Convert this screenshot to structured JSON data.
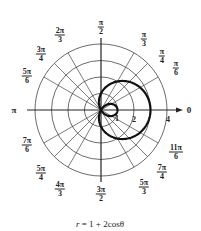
{
  "chart_data": {
    "type": "polar",
    "title": "",
    "equation": "r = 1 + 2cosθ",
    "caption": {
      "var": "r",
      "rest": " = 1 + 2cosθ"
    },
    "series": [
      {
        "name": "r = 1 + 2cosθ",
        "function": "1 + 2*cos(theta)",
        "theta_range": [
          0,
          6.2832
        ],
        "curve": "limaçon with inner loop"
      }
    ],
    "radial_ticks": [
      1,
      2,
      3,
      4
    ],
    "radial_labels": [
      {
        "r": 1,
        "text": "1"
      },
      {
        "r": 2,
        "text": "2"
      },
      {
        "r": 4,
        "text": "4"
      }
    ],
    "rmax": 4,
    "grid": true,
    "angle_labels": [
      {
        "deg": 0,
        "type": "single",
        "text": "0"
      },
      {
        "deg": 30,
        "type": "frac",
        "num": "π",
        "den": "6"
      },
      {
        "deg": 45,
        "type": "frac",
        "num": "π",
        "den": "4"
      },
      {
        "deg": 60,
        "type": "frac",
        "num": "π",
        "den": "3"
      },
      {
        "deg": 90,
        "type": "frac",
        "num": "π",
        "den": "2"
      },
      {
        "deg": 120,
        "type": "frac",
        "num": "2π",
        "den": "3"
      },
      {
        "deg": 135,
        "type": "frac",
        "num": "3π",
        "den": "4"
      },
      {
        "deg": 150,
        "type": "frac",
        "num": "5π",
        "den": "6"
      },
      {
        "deg": 180,
        "type": "single",
        "text": "π"
      },
      {
        "deg": 210,
        "type": "frac",
        "num": "7π",
        "den": "6"
      },
      {
        "deg": 225,
        "type": "frac",
        "num": "5π",
        "den": "4"
      },
      {
        "deg": 240,
        "type": "frac",
        "num": "4π",
        "den": "3"
      },
      {
        "deg": 270,
        "type": "frac",
        "num": "3π",
        "den": "2"
      },
      {
        "deg": 300,
        "type": "frac",
        "num": "5π",
        "den": "3"
      },
      {
        "deg": 315,
        "type": "frac",
        "num": "7π",
        "den": "4"
      },
      {
        "deg": 330,
        "type": "frac",
        "num": "11π",
        "den": "6"
      }
    ]
  },
  "labels": {
    "a0": "0",
    "a180": "π",
    "a30": {
      "num": "π",
      "den": "6"
    },
    "a45": {
      "num": "π",
      "den": "4"
    },
    "a60": {
      "num": "π",
      "den": "3"
    },
    "a90": {
      "num": "π",
      "den": "2"
    },
    "a120": {
      "num": "2π",
      "den": "3"
    },
    "a135": {
      "num": "3π",
      "den": "4"
    },
    "a150": {
      "num": "5π",
      "den": "6"
    },
    "a210": {
      "num": "7π",
      "den": "6"
    },
    "a225": {
      "num": "5π",
      "den": "4"
    },
    "a240": {
      "num": "4π",
      "den": "3"
    },
    "a270": {
      "num": "3π",
      "den": "2"
    },
    "a300": {
      "num": "5π",
      "den": "3"
    },
    "a315": {
      "num": "7π",
      "den": "4"
    },
    "a330": {
      "num": "11π",
      "den": "6"
    },
    "r1": "1",
    "r2": "2",
    "r4": "4"
  }
}
